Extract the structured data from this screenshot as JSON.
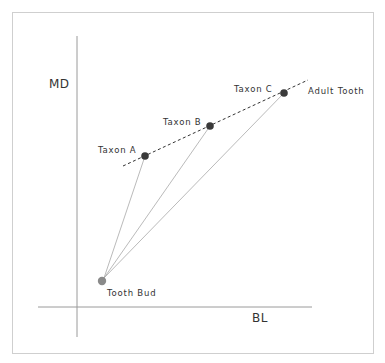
{
  "diagram": {
    "axes": {
      "y_label": "MD",
      "x_label": "BL"
    },
    "points": [
      {
        "id": "tooth_bud",
        "label": "Tooth Bud",
        "x": 102,
        "y": 281,
        "fill": "#8a8a8a"
      },
      {
        "id": "taxon_a",
        "label": "Taxon A",
        "x": 145,
        "y": 156,
        "fill": "#3a3a3a"
      },
      {
        "id": "taxon_b",
        "label": "Taxon B",
        "x": 210,
        "y": 126,
        "fill": "#3a3a3a"
      },
      {
        "id": "taxon_c",
        "label": "Taxon C",
        "x": 284,
        "y": 93,
        "fill": "#3a3a3a"
      }
    ],
    "trend_line": {
      "label": "Adult Tooth",
      "style": "dashed",
      "from": [
        123,
        166
      ],
      "to": [
        308,
        80
      ]
    },
    "growth_lines": [
      {
        "from": "tooth_bud",
        "to": "taxon_a"
      },
      {
        "from": "tooth_bud",
        "to": "taxon_b"
      },
      {
        "from": "tooth_bud",
        "to": "taxon_c"
      }
    ],
    "colors": {
      "axis": "#9a9a9a",
      "growth_line": "#a8a8a8",
      "dashed_line": "#333333",
      "border": "#cfcfcf"
    }
  }
}
